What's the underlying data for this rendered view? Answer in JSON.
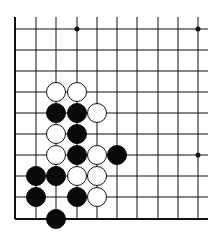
{
  "board": {
    "description": "Go board corner diagram (lower-left corner)",
    "grid": {
      "columns_x": [
        15,
        36,
        56,
        77,
        97,
        117,
        137,
        158,
        178,
        198
      ],
      "rows_y": [
        29,
        50,
        71,
        92,
        113,
        134,
        155,
        176,
        197,
        219
      ],
      "top_stub_y": 17,
      "right_extend_x": 208,
      "left_edge": true,
      "bottom_edge": true
    },
    "colors": {
      "line": "#111111",
      "black_stone": "#0a0a0a",
      "white_stone_fill": "#ffffff",
      "white_stone_stroke": "#111111",
      "background": "#ffffff"
    },
    "star_points": [
      [
        3,
        0
      ],
      [
        9,
        0
      ],
      [
        9,
        6
      ]
    ],
    "stones": [
      {
        "color": "white",
        "col": 2,
        "row": 3
      },
      {
        "color": "white",
        "col": 3,
        "row": 3
      },
      {
        "color": "black",
        "col": 2,
        "row": 4
      },
      {
        "color": "black",
        "col": 3,
        "row": 4
      },
      {
        "color": "white",
        "col": 4,
        "row": 4
      },
      {
        "color": "white",
        "col": 2,
        "row": 5
      },
      {
        "color": "black",
        "col": 3,
        "row": 5
      },
      {
        "color": "white",
        "col": 2,
        "row": 6
      },
      {
        "color": "black",
        "col": 3,
        "row": 6
      },
      {
        "color": "white",
        "col": 4,
        "row": 6
      },
      {
        "color": "black",
        "col": 5,
        "row": 6
      },
      {
        "color": "black",
        "col": 1,
        "row": 7
      },
      {
        "color": "black",
        "col": 2,
        "row": 7
      },
      {
        "color": "white",
        "col": 3,
        "row": 7
      },
      {
        "color": "white",
        "col": 4,
        "row": 7
      },
      {
        "color": "black",
        "col": 1,
        "row": 8
      },
      {
        "color": "black",
        "col": 3,
        "row": 8
      },
      {
        "color": "white",
        "col": 4,
        "row": 8
      },
      {
        "color": "black",
        "col": 2,
        "row": 9
      }
    ],
    "stone_radius": 9.5
  }
}
